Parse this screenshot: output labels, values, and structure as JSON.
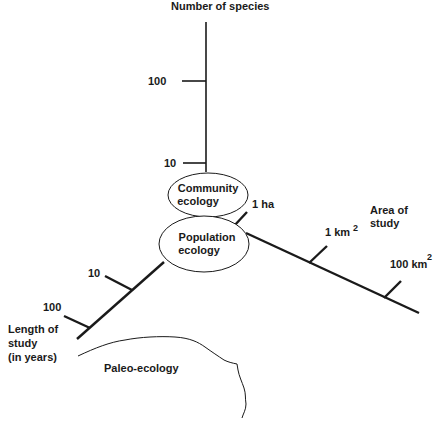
{
  "diagram": {
    "axes": {
      "species": {
        "title": "Number of species",
        "ticks": [
          {
            "label": "100"
          },
          {
            "label": "10"
          }
        ]
      },
      "area": {
        "title_line1": "Area of",
        "title_line2": "study",
        "ticks": [
          {
            "label": "1 ha"
          },
          {
            "label": "1 km",
            "sup": "2"
          },
          {
            "label": "100 km",
            "sup": "2"
          }
        ]
      },
      "length": {
        "title_line1": "Length of",
        "title_line2": "study",
        "title_line3": "(in years)",
        "ticks": [
          {
            "label": "10"
          },
          {
            "label": "100"
          }
        ]
      }
    },
    "regions": {
      "community": {
        "line1": "Community",
        "line2": "ecology"
      },
      "population": {
        "line1": "Population",
        "line2": "ecology"
      },
      "paleo": {
        "label": "Paleo-ecology"
      }
    },
    "colors": {
      "ink": "#1a1a1a",
      "background": "#ffffff"
    }
  }
}
